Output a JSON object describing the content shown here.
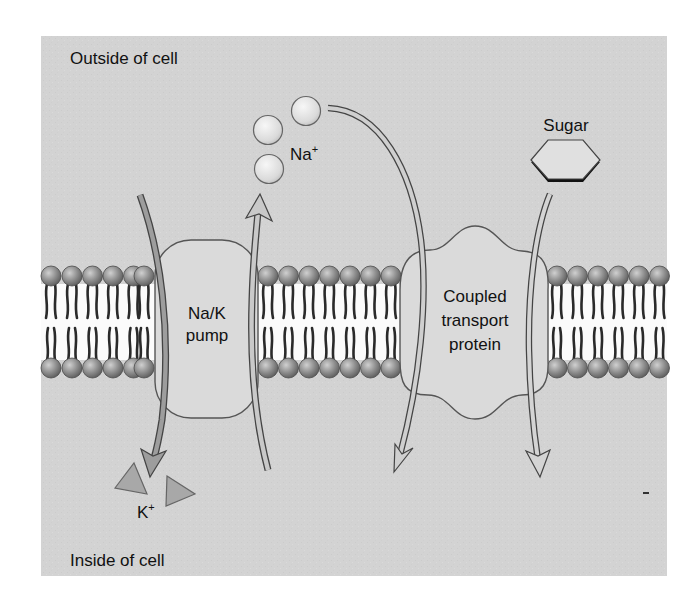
{
  "labels": {
    "outside": "Outside of cell",
    "inside": "Inside of cell",
    "sodium_base": "Na",
    "sodium_charge": "+",
    "potassium_base": "K",
    "potassium_charge": "+",
    "sugar": "Sugar",
    "pump_line1": "Na/K",
    "pump_line2": "pump",
    "coupled_line1": "Coupled",
    "coupled_line2": "transport",
    "coupled_line3": "protein"
  },
  "colors": {
    "page_background": "#ffffff",
    "panel_background": "#d4d4d4",
    "membrane_core": "#fafafa",
    "phospholipid_head": "#8a8a8a",
    "protein_fill": "#d9d9d9",
    "protein_stroke": "#555555",
    "arrow_dark": "#9a9a9a",
    "arrow_light": "#c8c8c8",
    "ion_fill": "#e2e2e2",
    "k_ion_fill": "#a9a9a9",
    "text": "#111111"
  },
  "membrane": {
    "top_head_row_y": 276,
    "bottom_head_row_y": 368,
    "head_radius": 10
  },
  "components": [
    {
      "id": "na-k-pump",
      "name": "Na/K pump"
    },
    {
      "id": "coupled-transport-protein",
      "name": "Coupled transport protein"
    }
  ],
  "molecules": {
    "sodium_ions": 3,
    "potassium_ions": 2,
    "sugar_molecules": 1
  },
  "transport_arrows": [
    {
      "id": "k-inward",
      "through": "Na/K pump",
      "direction": "in"
    },
    {
      "id": "na-outward",
      "through": "Na/K pump",
      "direction": "out"
    },
    {
      "id": "na-inward",
      "through": "Coupled transport protein",
      "direction": "in"
    },
    {
      "id": "sugar-inward",
      "through": "Coupled transport protein",
      "direction": "in"
    }
  ]
}
